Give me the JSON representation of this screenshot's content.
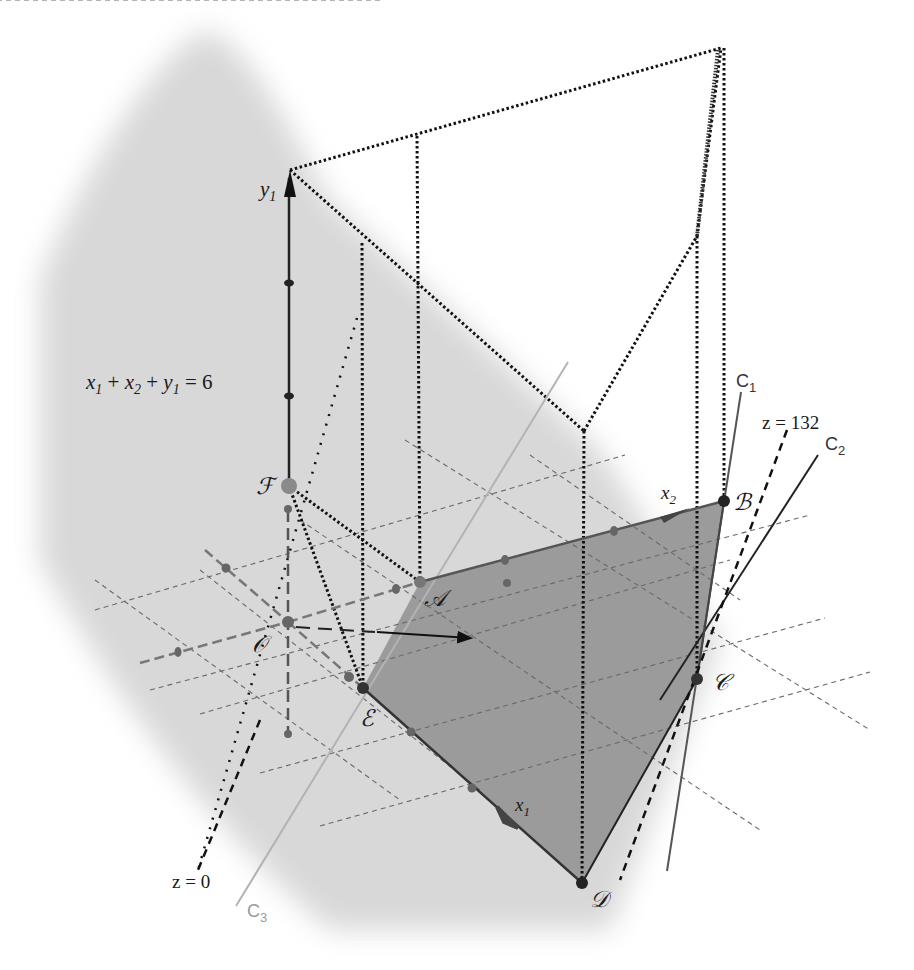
{
  "figure": {
    "type": "3d-linear-program-geometry",
    "colors": {
      "background": "#ffffff",
      "plane_shade": "#d9d9d9",
      "feasible_region": "#9a9a9a",
      "axis": "#1a1a1a",
      "grid": "#6e6e6e",
      "c3_line": "#b0b0b0",
      "vertex_points": "#2a2a2a"
    }
  },
  "labels": {
    "plane_equation": {
      "x1": "x",
      "x1_sub": "1",
      "plus1": " + ",
      "x2": "x",
      "x2_sub": "2",
      "plus2": " + ",
      "y1": "y",
      "y1_sub": "1",
      "eq": " = 6"
    },
    "axes": {
      "y1": {
        "base": "y",
        "sub": "1"
      },
      "x1": {
        "base": "x",
        "sub": "1"
      },
      "x2": {
        "base": "x",
        "sub": "2"
      }
    },
    "vertices": {
      "A": "𝒜",
      "B": "ℬ",
      "C": "𝒞",
      "D": "𝒟",
      "E": "ℰ",
      "F": "ℱ",
      "O": "𝒪"
    },
    "constraints": {
      "C1": {
        "base": "C",
        "sub": "1"
      },
      "C2": {
        "base": "C",
        "sub": "2"
      },
      "C3": {
        "base": "C",
        "sub": "3"
      }
    },
    "objective_levels": {
      "z0": "z = 0",
      "z132": "z = 132"
    }
  },
  "geometry": {
    "points": {
      "O": [
        288,
        622
      ],
      "A": [
        420,
        582
      ],
      "B": [
        724,
        501
      ],
      "C": [
        697,
        679
      ],
      "D": [
        582,
        883
      ],
      "E": [
        363,
        688
      ],
      "F": [
        289,
        486
      ],
      "y1_top": [
        290,
        170
      ],
      "top_right": [
        721,
        48
      ],
      "kink": [
        697,
        236
      ],
      "valley": [
        584,
        431
      ]
    },
    "feasible_region_vertices": [
      "A",
      "B",
      "C",
      "D",
      "E"
    ],
    "objective_direction_arrow": {
      "from": [
        377,
        632
      ],
      "to": [
        480,
        638
      ]
    }
  }
}
